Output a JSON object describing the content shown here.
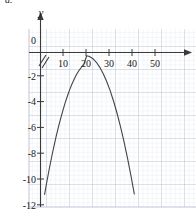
{
  "figure": {
    "label": "a."
  },
  "chart_data": {
    "type": "line",
    "title": "",
    "xlabel": "",
    "ylabel": "y",
    "xlim": [
      0,
      57
    ],
    "ylim": [
      -12,
      0.9
    ],
    "xticks": [
      10,
      20,
      30,
      40,
      50
    ],
    "xtick_labels": [
      "10",
      "20",
      "30",
      "40",
      "50"
    ],
    "yticks": [
      0,
      -2,
      -4,
      -6,
      -8,
      -10,
      -12
    ],
    "ytick_labels": [
      "0",
      "-2",
      "-4",
      "-6",
      "-8",
      "-10",
      "-12"
    ],
    "grid": true,
    "grid_minor_step_x": 1,
    "grid_minor_step_y": 0.2,
    "grid_major_step_x": 5,
    "grid_major_step_y": 1,
    "legend": "none",
    "axis_break_x": true,
    "axis_arrow_x": true,
    "axis_arrow_y": true,
    "curve_color": "#444444",
    "grid_color": "#c9cfe0",
    "axis_color": "#3a3a3a",
    "series": [
      {
        "name": "parabola",
        "vertex": [
          20.3,
          -0.25
        ],
        "x_intercepts": [],
        "x": [
          2.0,
          3.0,
          4.0,
          5.0,
          6.0,
          7.0,
          8.0,
          9.0,
          10.0,
          11.0,
          12.0,
          13.0,
          14.0,
          15.0,
          16.0,
          17.0,
          18.0,
          19.0,
          20.3,
          21.5,
          23.0,
          24.5,
          26.0,
          27.5,
          29.0,
          30.5,
          32.0,
          33.5,
          35.0,
          36.5,
          38.0,
          39.5,
          41.0
        ],
        "y": [
          -11.0,
          -10.0,
          -9.05,
          -8.16,
          -7.32,
          -6.53,
          -5.79,
          -5.1,
          -4.46,
          -3.87,
          -3.33,
          -2.84,
          -2.4,
          -2.01,
          -1.67,
          -1.38,
          -1.14,
          -0.95,
          -0.25,
          -0.31,
          -0.48,
          -0.76,
          -1.15,
          -1.64,
          -2.25,
          -2.96,
          -3.78,
          -4.71,
          -5.74,
          -6.89,
          -8.14,
          -9.5,
          -10.97
        ]
      }
    ]
  }
}
